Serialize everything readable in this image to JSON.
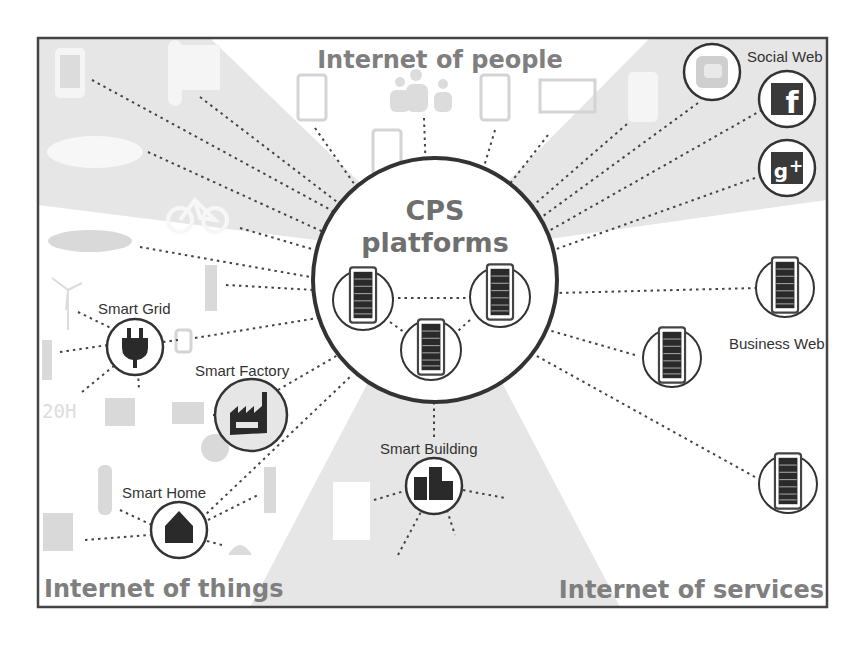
{
  "diagram": {
    "title": "CPS platforms",
    "center": {
      "line1": "CPS",
      "line2": "platforms",
      "servers": 3
    },
    "quadrants": {
      "top": "Internet of people",
      "bottom_left": "Internet of things",
      "bottom_right": "Internet of services"
    },
    "groups": {
      "social_web": {
        "label": "Social Web",
        "icons": [
          "twitter-icon",
          "facebook-icon",
          "google-plus-icon"
        ]
      },
      "business_web": {
        "label": "Business Web",
        "servers": 3
      },
      "smart_grid": {
        "label": "Smart Grid",
        "icon": "plug-icon"
      },
      "smart_factory": {
        "label": "Smart Factory",
        "icon": "factory-icon"
      },
      "smart_home": {
        "label": "Smart Home",
        "icon": "house-icon"
      },
      "smart_building": {
        "label": "Smart Building",
        "icon": "buildings-icon"
      }
    },
    "people_devices": [
      "tablet-icon",
      "people-icon",
      "tablet-icon",
      "monitor-icon",
      "phone-icon",
      "tablet-icon"
    ],
    "things_devices": [
      "phone-icon",
      "thermometer-icon",
      "electric-car-icon",
      "bicycle-icon",
      "electric-car-icon",
      "wind-turbine-icon",
      "light-switch-icon",
      "battery-icon",
      "solar-panel-icon",
      "heater-icon",
      "washing-machine-icon",
      "bulb-icon",
      "sensor-icon",
      "door-icon"
    ],
    "colors": {
      "background": "#ffffff",
      "shade": "#e6e6e6",
      "frame": "#444444",
      "quadrant_text": "#7f7f7f",
      "label_text": "#333333"
    }
  }
}
